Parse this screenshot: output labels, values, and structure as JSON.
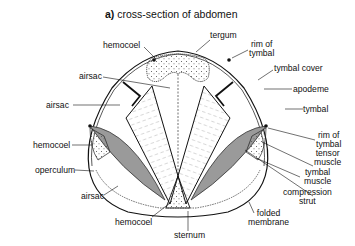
{
  "figure": {
    "panel_letter": "a)",
    "title": "cross-section of abdomen"
  },
  "labels": {
    "hemocoel_top": "hemocoel",
    "tergum": "tergum",
    "rim_of_tymbal_top_1": "rim of",
    "rim_of_tymbal_top_2": "tymbal",
    "airsac_upper": "airsac",
    "tymbal_cover": "tymbal cover",
    "airsac_left": "airsac",
    "apodeme": "apodeme",
    "tymbal": "tymbal",
    "hemocoel_left": "hemocoel",
    "rim_of_tymbal_right_1": "rim of",
    "rim_of_tymbal_right_2": "tymbal",
    "tensor_muscle_1": "tensor",
    "tensor_muscle_2": "muscle",
    "operculum": "operculum",
    "tymbal_muscle_1": "tymbal",
    "tymbal_muscle_2": "muscle",
    "airsac_lower": "airsac",
    "compression_strut_1": "compression",
    "compression_strut_2": "strut",
    "hemocoel_bottom": "hemocoel",
    "sternum": "sternum",
    "folded_membrane_1": "folded",
    "folded_membrane_2": "membrane"
  },
  "colors": {
    "ink": "#111111",
    "muscle_fill": "#9a9a9a",
    "stipple": "#555555",
    "background": "#ffffff"
  }
}
